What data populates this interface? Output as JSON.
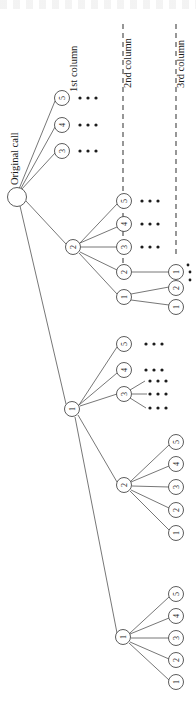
{
  "figure": {
    "root": {
      "label": "",
      "name": "root-node"
    },
    "labels": {
      "original_call": "Original call",
      "column1": "1st column",
      "column2": "2nd column",
      "column3": "3rd column"
    },
    "ellipsis": "• • •",
    "colors": {
      "stroke": "#4a4a4a",
      "text": "#1a1a1a",
      "node_fill": "#ffffff",
      "background": "#ffffff",
      "dash": "#3a3a3a"
    },
    "column1_nodes": [
      "5",
      "4",
      "3",
      "2",
      "1"
    ],
    "column2_nodes": [
      "5",
      "4",
      "3",
      "2",
      "1"
    ],
    "column3_nodes": [
      "5",
      "4",
      "3",
      "2",
      "1"
    ],
    "nodes": [
      {
        "id": "root",
        "label": "",
        "x": 17,
        "y": 197,
        "r": 9.5
      },
      {
        "id": "c1-5",
        "label": "5",
        "x": 62,
        "y": 98,
        "r": 7.5
      },
      {
        "id": "c1-4",
        "label": "4",
        "x": 62,
        "y": 125,
        "r": 7.5
      },
      {
        "id": "c1-3",
        "label": "3",
        "x": 62,
        "y": 151,
        "r": 7.5
      },
      {
        "id": "c1-2",
        "label": "2",
        "x": 73,
        "y": 247,
        "r": 7.5
      },
      {
        "id": "c1-1",
        "label": "1",
        "x": 72,
        "y": 409,
        "r": 7.5
      },
      {
        "id": "c2a-5",
        "label": "5",
        "x": 124,
        "y": 201,
        "r": 7.5
      },
      {
        "id": "c2a-4",
        "label": "4",
        "x": 124,
        "y": 224,
        "r": 7.5
      },
      {
        "id": "c2a-3",
        "label": "3",
        "x": 124,
        "y": 247,
        "r": 7.5
      },
      {
        "id": "c2a-2",
        "label": "2",
        "x": 124,
        "y": 272,
        "r": 7.5
      },
      {
        "id": "c2a-1",
        "label": "1",
        "x": 124,
        "y": 297,
        "r": 7.5
      },
      {
        "id": "c3a-1",
        "label": "1",
        "x": 176,
        "y": 272,
        "r": 7.5
      },
      {
        "id": "c3b-2",
        "label": "2",
        "x": 176,
        "y": 288,
        "r": 7.5
      },
      {
        "id": "c3b-1",
        "label": "1",
        "x": 176,
        "y": 307,
        "r": 7.5
      },
      {
        "id": "c2b-5",
        "label": "5",
        "x": 124,
        "y": 344,
        "r": 7.5
      },
      {
        "id": "c2b-4",
        "label": "4",
        "x": 124,
        "y": 370,
        "r": 7.5
      },
      {
        "id": "c2b-3",
        "label": "3",
        "x": 124,
        "y": 394,
        "r": 7.5
      },
      {
        "id": "c2b-2",
        "label": "2",
        "x": 124,
        "y": 485,
        "r": 7.5
      },
      {
        "id": "c2b-1",
        "label": "1",
        "x": 123,
        "y": 637,
        "r": 7.5
      },
      {
        "id": "c3c-5",
        "label": "5",
        "x": 176,
        "y": 442,
        "r": 7.5
      },
      {
        "id": "c3c-4",
        "label": "4",
        "x": 176,
        "y": 464,
        "r": 7.5
      },
      {
        "id": "c3c-3",
        "label": "3",
        "x": 176,
        "y": 487,
        "r": 7.5
      },
      {
        "id": "c3c-2",
        "label": "2",
        "x": 176,
        "y": 510,
        "r": 7.5
      },
      {
        "id": "c3c-1",
        "label": "1",
        "x": 176,
        "y": 533,
        "r": 7.5
      },
      {
        "id": "c3d-5",
        "label": "5",
        "x": 176,
        "y": 594,
        "r": 7.5
      },
      {
        "id": "c3d-4",
        "label": "4",
        "x": 176,
        "y": 616,
        "r": 7.5
      },
      {
        "id": "c3d-3",
        "label": "3",
        "x": 176,
        "y": 638,
        "r": 7.5
      },
      {
        "id": "c3d-2",
        "label": "2",
        "x": 176,
        "y": 660,
        "r": 7.5
      },
      {
        "id": "c3d-1",
        "label": "1",
        "x": 176,
        "y": 682,
        "r": 7.5
      }
    ]
  }
}
